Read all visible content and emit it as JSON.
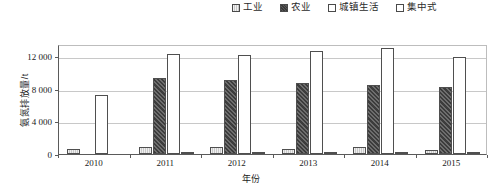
{
  "legend": {
    "position": "top-right",
    "entries": [
      {
        "label": "工业",
        "icon": "legend-swatch-industry"
      },
      {
        "label": "农业",
        "icon": "legend-swatch-agriculture"
      },
      {
        "label": "城镇生活",
        "icon": "legend-swatch-urban-domestic"
      },
      {
        "label": "集中式",
        "icon": "legend-swatch-centralized"
      }
    ]
  },
  "axes": {
    "y_title": "氨氮排放量/t",
    "x_title": "年份",
    "y_ticks": [
      "0",
      "4 000",
      "8 000",
      "12 000"
    ],
    "x_ticks": [
      "2010",
      "2011",
      "2012",
      "2013",
      "2014",
      "2015"
    ]
  },
  "chart_data": {
    "type": "bar",
    "title": "",
    "xlabel": "年份",
    "ylabel": "氨氮排放量/t",
    "categories": [
      "2010",
      "2011",
      "2012",
      "2013",
      "2014",
      "2015"
    ],
    "series": [
      {
        "name": "工业",
        "values": [
          600,
          900,
          800,
          600,
          900,
          550
        ]
      },
      {
        "name": "农业",
        "values": [
          null,
          9350,
          9100,
          8700,
          8500,
          8200
        ]
      },
      {
        "name": "城镇生活",
        "values": [
          7200,
          12250,
          12150,
          12700,
          13000,
          11900
        ]
      },
      {
        "name": "集中式",
        "values": [
          null,
          150,
          120,
          150,
          180,
          150
        ]
      }
    ],
    "ylim": [
      0,
      13500
    ],
    "yticks": [
      0,
      4000,
      8000,
      12000
    ],
    "grid": true,
    "legend_position": "top-right"
  }
}
